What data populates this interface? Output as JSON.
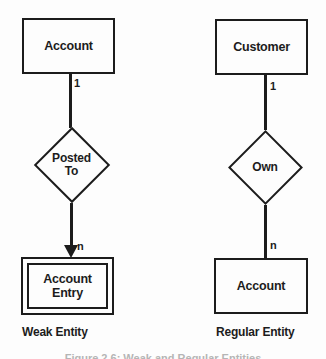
{
  "colors": {
    "ink": "#1c1c1c",
    "background": "#fdfdfd",
    "caption_gray": "#b5b5b5"
  },
  "weak": {
    "entity": "Account",
    "cardinality_one": "1",
    "relationship_line1": "Posted",
    "relationship_line2": "To",
    "cardinality_many": "n",
    "dependent_entity_line1": "Account",
    "dependent_entity_line2": "Entry",
    "caption": "Weak Entity"
  },
  "regular": {
    "entity": "Customer",
    "cardinality_one": "1",
    "relationship": "Own",
    "cardinality_many": "n",
    "owned_entity": "Account",
    "caption": "Regular Entity"
  },
  "figure_caption": "Figure 2.6: Weak and Regular Entities"
}
